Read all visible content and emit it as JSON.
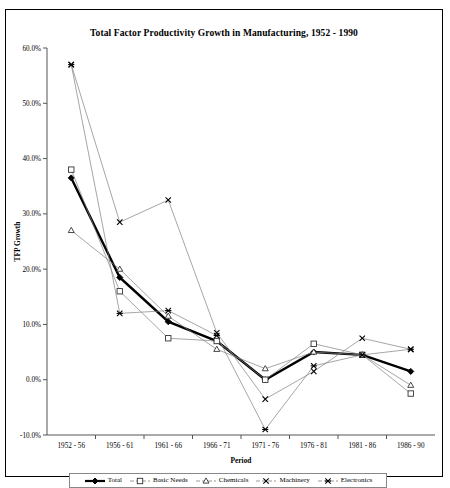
{
  "chart_data": {
    "type": "line",
    "title": "Total Factor Productivity Growth in Manufacturing, 1952 - 1990",
    "xlabel": "Period",
    "ylabel": "TFP Growth",
    "categories": [
      "1952 - 56",
      "1956 - 61",
      "1961 - 66",
      "1966 - 71",
      "1971 - 76",
      "1976 - 81",
      "1981 - 86",
      "1986 - 90"
    ],
    "ylim": [
      -10,
      60
    ],
    "ytick_values": [
      -10,
      0,
      10,
      20,
      30,
      40,
      50,
      60
    ],
    "ytick_labels": [
      "-10.0%",
      "0.0%",
      "10.0%",
      "20.0%",
      "30.0%",
      "40.0%",
      "50.0%",
      "60.0%"
    ],
    "grid": false,
    "legend_position": "bottom",
    "series": [
      {
        "name": "Total",
        "marker": "diamond",
        "emphasis": true,
        "values": [
          36.5,
          18.5,
          10.5,
          7.0,
          0.0,
          5.0,
          4.5,
          1.5
        ]
      },
      {
        "name": "Basic Needs",
        "marker": "square",
        "emphasis": false,
        "values": [
          38.0,
          16.0,
          7.5,
          7.0,
          0.0,
          6.5,
          4.5,
          -2.5
        ]
      },
      {
        "name": "Chemicals",
        "marker": "triangle",
        "emphasis": false,
        "values": [
          27.0,
          20.0,
          11.5,
          5.5,
          2.0,
          5.0,
          4.5,
          -1.0
        ]
      },
      {
        "name": "Machinery",
        "marker": "cross",
        "emphasis": false,
        "values": [
          57.0,
          28.5,
          32.5,
          8.5,
          -3.5,
          1.5,
          7.5,
          5.5
        ]
      },
      {
        "name": "Electronics",
        "marker": "star",
        "emphasis": false,
        "values": [
          57.0,
          12.0,
          12.5,
          8.0,
          -9.0,
          2.5,
          4.5,
          5.5
        ]
      }
    ]
  },
  "legend": {
    "items": [
      {
        "label": "Total"
      },
      {
        "label": "Basic Needs"
      },
      {
        "label": "Chemicals"
      },
      {
        "label": "Machinery"
      },
      {
        "label": "Electronics"
      }
    ]
  },
  "colors": {
    "series_line": "#808080",
    "emphasis_line": "#000000",
    "axis": "#555555",
    "frame": "#000000",
    "background": "#ffffff"
  }
}
